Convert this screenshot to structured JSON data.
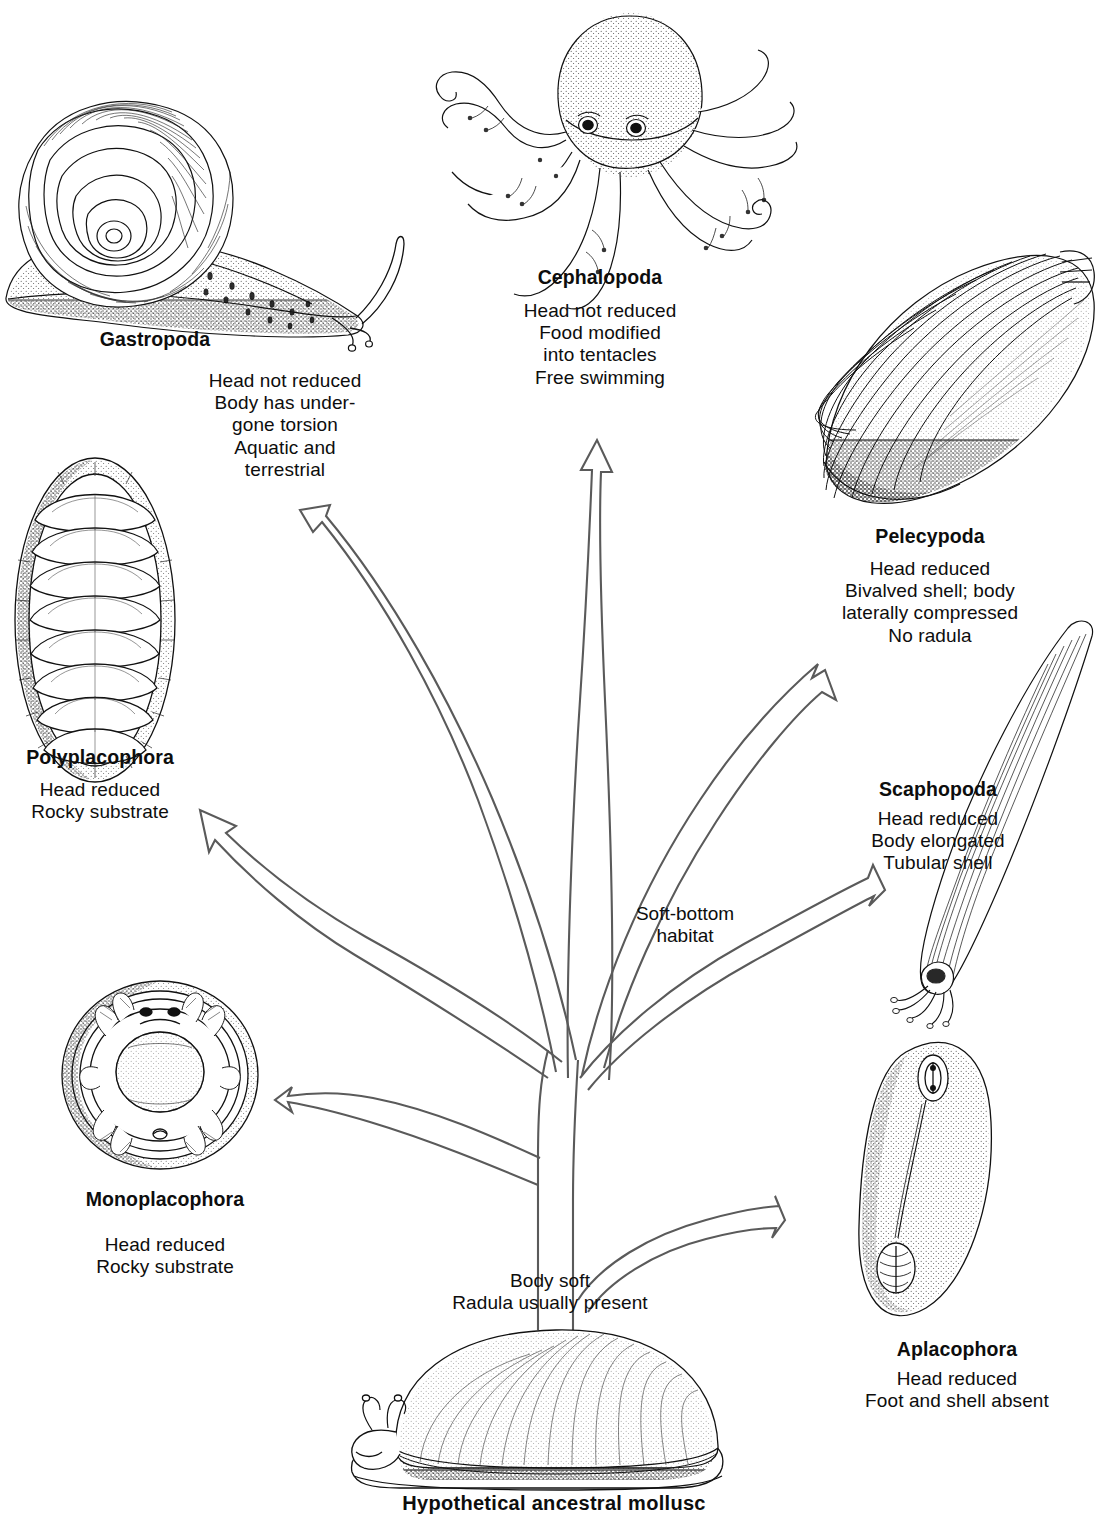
{
  "figure": {
    "title": "Hypothetical ancestral mollusc",
    "root_note": [
      "Body soft",
      "Radula usually present"
    ],
    "habitat_note": [
      "Soft-bottom",
      "habitat"
    ],
    "ink_color": "#111111",
    "arrow_color": "#5a5a5a"
  },
  "classes": [
    {
      "id": "gastropoda",
      "name": "Gastropoda",
      "traits": [
        "Head not reduced",
        "Body has under-",
        "gone torsion",
        "Aquatic and",
        "terrestrial"
      ],
      "art": "snail-drawing"
    },
    {
      "id": "cephalopoda",
      "name": "Cephalopoda",
      "traits": [
        "Head not reduced",
        "Food modified",
        "into tentacles",
        "Free swimming"
      ],
      "art": "octopus-drawing"
    },
    {
      "id": "pelecypoda",
      "name": "Pelecypoda",
      "traits": [
        "Head  reduced",
        "Bivalved shell; body",
        "laterally compressed",
        "No radula"
      ],
      "art": "clam-drawing"
    },
    {
      "id": "scaphopoda",
      "name": "Scaphopoda",
      "traits": [
        "Head reduced",
        "Body elongated",
        "Tubular shell"
      ],
      "art": "tusk-shell-drawing"
    },
    {
      "id": "polyplacophora",
      "name": "Polyplacophora",
      "traits": [
        "Head reduced",
        "Rocky substrate"
      ],
      "art": "chiton-drawing"
    },
    {
      "id": "monoplacophora",
      "name": "Monoplacophora",
      "traits": [
        "Head reduced",
        "Rocky substrate"
      ],
      "art": "neopilina-drawing"
    },
    {
      "id": "aplacophora",
      "name": "Aplacophora",
      "traits": [
        "Head reduced",
        "Foot and shell absent"
      ],
      "art": "solenogaster-drawing"
    }
  ],
  "ancestor": {
    "art": "ancestral-mollusc-drawing"
  }
}
